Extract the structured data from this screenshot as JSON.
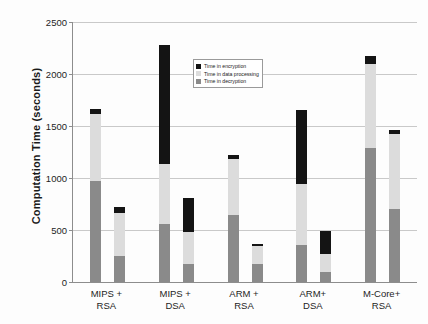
{
  "chart_data": {
    "type": "bar",
    "title": "",
    "subtitle": "",
    "xlabel": "",
    "ylabel": "Computation Time (seconds)",
    "ylim": [
      0,
      2500
    ],
    "yticks": [
      0,
      500,
      1000,
      1500,
      2000,
      2500
    ],
    "ytick_labels": [
      "0",
      "500",
      "1000",
      "1500",
      "2000",
      "2500"
    ],
    "grid": true,
    "stacked": true,
    "legend_position": "inside-upper-center",
    "categories": [
      "MIPS + RSA",
      "MIPS + DSA",
      "ARM + RSA",
      "ARM+ DSA",
      "M-Core+ RSA"
    ],
    "category_lines": [
      [
        "MIPS +",
        "RSA"
      ],
      [
        "MIPS +",
        "DSA"
      ],
      [
        "ARM +",
        "RSA"
      ],
      [
        "ARM+",
        "DSA"
      ],
      [
        "M-Core+",
        "RSA"
      ]
    ],
    "bars_per_category": 2,
    "series": [
      {
        "name": "Time in encryption",
        "color": "#141414",
        "values": [
          [
            40,
            60
          ],
          [
            1145,
            330
          ],
          [
            35,
            20
          ],
          [
            710,
            220
          ],
          [
            70,
            40
          ]
        ]
      },
      {
        "name": "Time in data processing",
        "color": "#dcdcdc",
        "values": [
          [
            650,
            410
          ],
          [
            575,
            310
          ],
          [
            545,
            180
          ],
          [
            580,
            170
          ],
          [
            810,
            720
          ]
        ]
      },
      {
        "name": "Time in decryption",
        "color": "#8a8a8a",
        "values": [
          [
            970,
            250
          ],
          [
            560,
            170
          ],
          [
            640,
            170
          ],
          [
            360,
            100
          ],
          [
            1290,
            700
          ]
        ]
      }
    ],
    "totals": [
      [
        1660,
        720
      ],
      [
        2280,
        810
      ],
      [
        1220,
        370
      ],
      [
        1650,
        490
      ],
      [
        2170,
        1460
      ]
    ]
  },
  "legend": {
    "items": [
      {
        "label": "Time in encryption",
        "color": "#141414"
      },
      {
        "label": "Time in data processing",
        "color": "#dcdcdc"
      },
      {
        "label": "Time in decryption",
        "color": "#8a8a8a"
      }
    ]
  },
  "axis": {
    "y_title": "Computation Time (seconds)"
  }
}
